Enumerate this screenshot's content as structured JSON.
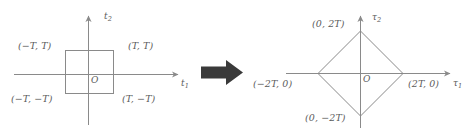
{
  "figure": {
    "type": "math-diagram-transformation",
    "background_color": "#ffffff",
    "line_color": "#8a8a8a",
    "text_color": "#5b5b5b",
    "arrow_color": "#3a3a3a",
    "left_panel": {
      "name": "square-region",
      "shape": "square",
      "axes": {
        "x_label": "t",
        "x_label_sub": "1",
        "y_label": "t",
        "y_label_sub": "2"
      },
      "origin_label": "O",
      "vertices": [
        {
          "name": "top-left",
          "label_open": "(",
          "x": "−T",
          "comma": ", ",
          "y": "T",
          "label_close": ")"
        },
        {
          "name": "top-right",
          "label_open": "(",
          "x": "T",
          "comma": ", ",
          "y": "T",
          "label_close": ")"
        },
        {
          "name": "bottom-left",
          "label_open": "(",
          "x": "−T",
          "comma": ", ",
          "y": "−T",
          "label_close": ")"
        },
        {
          "name": "bottom-right",
          "label_open": "(",
          "x": "T",
          "comma": ", ",
          "y": "−T",
          "label_close": ")"
        }
      ],
      "labels": {
        "top_left": "(−T, T)",
        "top_right": "(T, T)",
        "bottom_left": "(−T, −T)",
        "bottom_right": "(T, −T)"
      }
    },
    "transform_arrow": {
      "name": "transformation-arrow",
      "direction": "right"
    },
    "right_panel": {
      "name": "diamond-region",
      "shape": "diamond",
      "axes": {
        "x_label": "τ",
        "x_label_sub": "1",
        "y_label": "τ",
        "y_label_sub": "2"
      },
      "origin_label": "O",
      "labels": {
        "top": "(0, 2T)",
        "left": "(−2T, 0)",
        "right": "(2T, 0)",
        "bottom": "(0, −2T)"
      }
    }
  }
}
